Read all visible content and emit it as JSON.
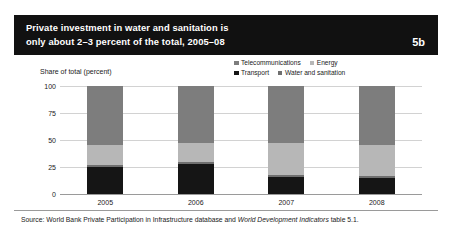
{
  "header": {
    "title_line1": "Private investment in water and sanitation is",
    "title_line2": "only about 2–3 percent of the total, 2005–08",
    "badge": "5b",
    "background_color": "#111111",
    "text_color": "#ffffff"
  },
  "source": {
    "prefix": "Source: World Bank Private Participation in Infrastructure database and ",
    "italic": "World Development Indicators",
    "suffix": " table 5.1."
  },
  "chart_data": {
    "type": "bar",
    "stacked": true,
    "title": "",
    "xlabel": "",
    "ylabel": "Share of total (percent)",
    "categories": [
      "2005",
      "2006",
      "2007",
      "2008"
    ],
    "yticks": [
      "100",
      "75",
      "50",
      "25",
      "0"
    ],
    "ytick_values": [
      100,
      75,
      50,
      25,
      0
    ],
    "ylim": [
      0,
      100
    ],
    "grid": true,
    "legend_position": "top-right",
    "series": [
      {
        "name": "Transport",
        "color": "#151515",
        "values": [
          25,
          28,
          16,
          15
        ]
      },
      {
        "name": "Water and sanitation",
        "color": "#6f6f6f",
        "values": [
          2,
          2,
          2,
          2
        ]
      },
      {
        "name": "Energy",
        "color": "#b7b7b7",
        "values": [
          18,
          17,
          29,
          28
        ]
      },
      {
        "name": "Telecommunications",
        "color": "#7d7d7d",
        "values": [
          55,
          53,
          53,
          55
        ]
      }
    ],
    "legend_rows": [
      [
        {
          "name": "Telecommunications",
          "color": "#7d7d7d"
        },
        {
          "name": "Energy",
          "color": "#b7b7b7"
        }
      ],
      [
        {
          "name": "Transport",
          "color": "#151515"
        },
        {
          "name": "Water and sanitation",
          "color": "#6f6f6f"
        }
      ]
    ]
  }
}
